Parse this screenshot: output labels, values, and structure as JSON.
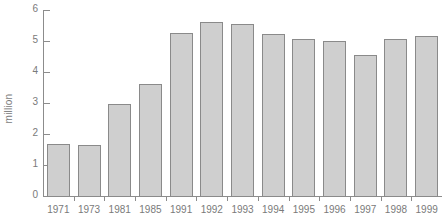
{
  "chart_data": {
    "type": "bar",
    "title": "",
    "xlabel": "",
    "ylabel": "million",
    "ylim": [
      0,
      6
    ],
    "yticks": [
      0,
      1,
      2,
      3,
      4,
      5,
      6
    ],
    "ytick_labels": [
      "0",
      "1",
      "2",
      "3",
      "4",
      "5",
      "6"
    ],
    "grid": false,
    "legend": null,
    "categories": [
      "1971",
      "1973",
      "1981",
      "1985",
      "1991",
      "1992",
      "1993",
      "1994",
      "1995",
      "1996",
      "1997",
      "1998",
      "1999"
    ],
    "values": [
      1.68,
      1.66,
      2.97,
      3.6,
      5.27,
      5.6,
      5.55,
      5.23,
      5.07,
      5.0,
      4.55,
      5.07,
      5.17
    ],
    "series": [
      {
        "name": "million",
        "values": [
          1.68,
          1.66,
          2.97,
          3.6,
          5.27,
          5.6,
          5.55,
          5.23,
          5.07,
          5.0,
          4.55,
          5.07,
          5.17
        ]
      }
    ],
    "bar_fill_color": "#cfcfcf",
    "bar_border_color": "#8a8a8a",
    "axis_color": "#8c8c8c",
    "text_color": "#7a7a7a",
    "background_color": "#ffffff"
  }
}
